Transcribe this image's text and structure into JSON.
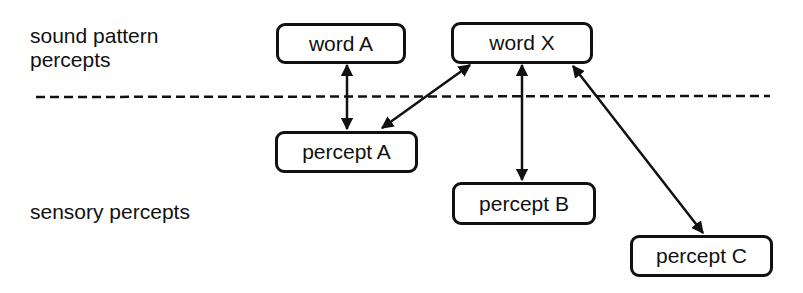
{
  "diagram": {
    "region_labels": {
      "upper_line1": "sound pattern",
      "upper_line2": "percepts",
      "lower": "sensory percepts"
    },
    "nodes": [
      {
        "id": "word_a",
        "label": "word A",
        "layer": "sound pattern percepts"
      },
      {
        "id": "word_x",
        "label": "word X",
        "layer": "sound pattern percepts"
      },
      {
        "id": "percept_a",
        "label": "percept A",
        "layer": "sensory percepts"
      },
      {
        "id": "percept_b",
        "label": "percept B",
        "layer": "sensory percepts"
      },
      {
        "id": "percept_c",
        "label": "percept C",
        "layer": "sensory percepts"
      }
    ],
    "edges": [
      {
        "from": "word_a",
        "to": "percept_a",
        "direction": "bidirectional"
      },
      {
        "from": "word_x",
        "to": "percept_a",
        "direction": "bidirectional"
      },
      {
        "from": "word_x",
        "to": "percept_b",
        "direction": "bidirectional"
      },
      {
        "from": "word_x",
        "to": "percept_c",
        "direction": "bidirectional"
      }
    ],
    "separator": "dashed horizontal line",
    "colors": {
      "ink": "#111111",
      "background": "#ffffff"
    }
  }
}
